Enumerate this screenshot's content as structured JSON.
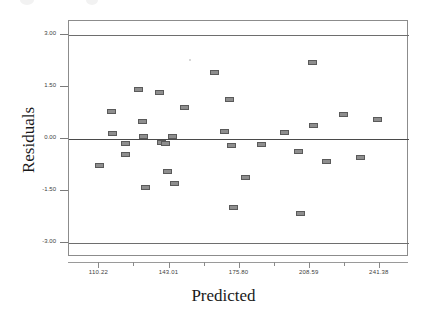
{
  "chart_data": {
    "type": "scatter",
    "title": "",
    "xlabel": "Predicted",
    "ylabel": "Residuals",
    "xlim": [
      96.0,
      255.0
    ],
    "ylim": [
      -3.4,
      3.4
    ],
    "xticks": [
      110.22,
      143.01,
      175.8,
      208.59,
      241.38
    ],
    "xtick_labels": [
      "110.22",
      "143.01",
      "175.80",
      "208.59",
      "241.38"
    ],
    "yticks": [
      3.0,
      1.5,
      0.0,
      -1.5,
      -3.0
    ],
    "ytick_labels": [
      "3.00",
      "1.50",
      "0.00",
      "-1.50",
      "-3.00"
    ],
    "grid": false,
    "legend": null,
    "reference_lines": [
      {
        "y": 3.0,
        "style": "solid",
        "color": "#6e6e6e"
      },
      {
        "y": 0.0,
        "style": "solid",
        "color": "#4a4a4a"
      },
      {
        "y": -3.0,
        "style": "solid",
        "color": "#6e6e6e"
      }
    ],
    "marker": {
      "shape": "rect",
      "facecolor": "#8e8e8e",
      "edgecolor": "#5a5a5a"
    },
    "points": [
      {
        "x": 110.4,
        "y": -0.77
      },
      {
        "x": 116.1,
        "y": 0.79
      },
      {
        "x": 116.4,
        "y": 0.16
      },
      {
        "x": 122.3,
        "y": -0.13
      },
      {
        "x": 122.6,
        "y": -0.45
      },
      {
        "x": 128.4,
        "y": 1.43
      },
      {
        "x": 130.6,
        "y": 0.49
      },
      {
        "x": 131.0,
        "y": 0.07
      },
      {
        "x": 131.9,
        "y": -1.4
      },
      {
        "x": 138.2,
        "y": 1.35
      },
      {
        "x": 139.1,
        "y": -0.11
      },
      {
        "x": 141.1,
        "y": -0.12
      },
      {
        "x": 141.9,
        "y": -0.95
      },
      {
        "x": 144.6,
        "y": 0.07
      },
      {
        "x": 145.4,
        "y": -1.28
      },
      {
        "x": 150.0,
        "y": 0.91
      },
      {
        "x": 164.2,
        "y": 1.93
      },
      {
        "x": 168.6,
        "y": 0.22
      },
      {
        "x": 171.0,
        "y": 1.13
      },
      {
        "x": 172.1,
        "y": -0.18
      },
      {
        "x": 172.9,
        "y": -1.96
      },
      {
        "x": 178.6,
        "y": -1.1
      },
      {
        "x": 186.2,
        "y": -0.17
      },
      {
        "x": 196.9,
        "y": 0.2
      },
      {
        "x": 203.2,
        "y": -0.36
      },
      {
        "x": 204.4,
        "y": -2.16
      },
      {
        "x": 209.9,
        "y": 2.21
      },
      {
        "x": 210.4,
        "y": 0.38
      },
      {
        "x": 216.4,
        "y": -0.64
      },
      {
        "x": 224.6,
        "y": 0.72
      },
      {
        "x": 232.5,
        "y": -0.53
      },
      {
        "x": 240.3,
        "y": 0.56
      }
    ]
  }
}
